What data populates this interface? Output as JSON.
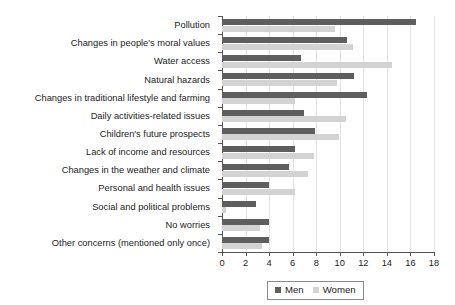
{
  "chart_data": {
    "type": "bar",
    "orientation": "horizontal",
    "title": "",
    "xlabel": "",
    "ylabel": "",
    "xlim": [
      0,
      18
    ],
    "xticks": [
      0,
      2,
      4,
      6,
      8,
      10,
      12,
      14,
      16,
      18
    ],
    "grid": true,
    "legend_position": "bottom",
    "categories": [
      "Pollution",
      "Changes in people's moral values",
      "Water access",
      "Natural hazards",
      "Changes in traditional lifestyle and farming",
      "Daily activities-related issues",
      "Children's future prospects",
      "Lack of income and resources",
      "Changes in the weather and climate",
      "Personal and health issues",
      "Social and political problems",
      "No worries",
      "Other concerns (mentioned only once)"
    ],
    "series": [
      {
        "name": "Men",
        "color": "#5e5e5e",
        "values": [
          16.5,
          10.6,
          6.7,
          11.2,
          12.3,
          7.0,
          7.9,
          6.2,
          5.7,
          4.0,
          2.9,
          4.0,
          4.0
        ]
      },
      {
        "name": "Women",
        "color": "#d3d3d3",
        "values": [
          9.6,
          11.1,
          14.4,
          9.8,
          6.2,
          10.5,
          9.9,
          7.8,
          7.3,
          6.2,
          0.3,
          3.2,
          3.4
        ]
      }
    ]
  },
  "legend": {
    "items": [
      {
        "label": "Men",
        "color": "#5e5e5e"
      },
      {
        "label": "Women",
        "color": "#d3d3d3"
      }
    ]
  }
}
